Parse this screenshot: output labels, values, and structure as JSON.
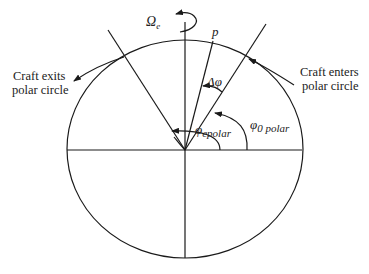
{
  "diagram": {
    "type": "polar-orbit-geometry",
    "labels": {
      "omega": "Ω",
      "omega_sub": "e",
      "point_p": "p",
      "delta_phi": "Δφ",
      "phi_e": "φ",
      "phi_e_sub": "epolar",
      "phi_0": "φ",
      "phi_0_sub": "0 polar",
      "exit_line1": "Craft exits",
      "exit_line2": "polar circle",
      "enter_line1": "Craft enters",
      "enter_line2": "polar circle"
    },
    "colors": {
      "stroke": "#1a1a1a",
      "text": "#222222",
      "background": "#ffffff"
    }
  }
}
